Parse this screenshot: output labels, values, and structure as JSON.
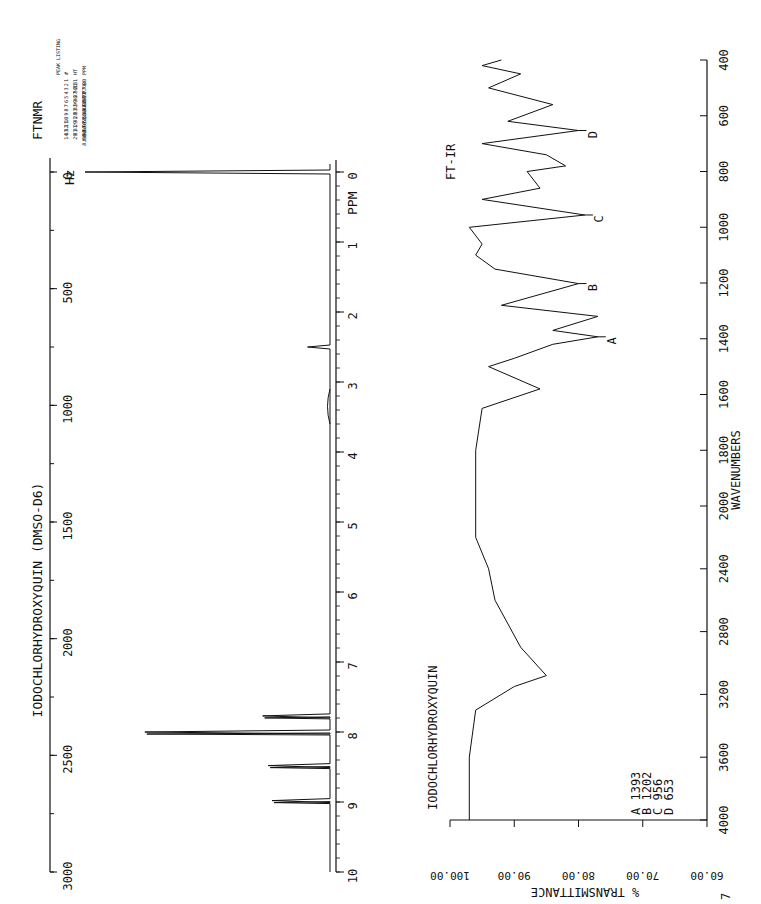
{
  "nmr": {
    "title": "IODOCHLORHYDROXYQUIN (DMSO-D6)",
    "instrument_label": "FTNMR",
    "hz_label": "Hz",
    "ppm_label": "PPM",
    "hz_ticks": [
      "0",
      "500",
      "1000",
      "1500",
      "2000",
      "2500",
      "3000"
    ],
    "ppm_ticks": [
      "0",
      "1",
      "2",
      "3",
      "4",
      "5",
      "6",
      "7",
      "8",
      "9",
      "10"
    ],
    "peak_listing": {
      "title": "PEAK LISTING",
      "headers": [
        "#",
        "HT",
        "PPM"
      ],
      "rows": [
        [
          "1",
          "131",
          ".00"
        ],
        [
          "2",
          "31",
          "7.76"
        ],
        [
          "3",
          "36",
          "7.77"
        ],
        [
          "4",
          "37",
          "7.78"
        ],
        [
          "5",
          "36",
          "7.80"
        ],
        [
          "6",
          "99",
          "8.00"
        ],
        [
          "7",
          "32",
          "8.46"
        ],
        [
          "8",
          "33",
          "8.48"
        ],
        [
          "9",
          "28",
          "8.51"
        ],
        [
          "10",
          "31",
          "8.51"
        ],
        [
          "11",
          "29",
          "8.97"
        ],
        [
          "12",
          "31",
          "8.97"
        ],
        [
          "13",
          "31",
          "8.98"
        ],
        [
          "14",
          "29",
          "8.99"
        ]
      ]
    }
  },
  "ir": {
    "title": "FT-IR",
    "compound": "IODOCHLORHYDROXYQUIN",
    "xlabel": "WAVENUMBERS",
    "ylabel": "% TRANSMITTANCE",
    "x_ticks": [
      "4000",
      "3600",
      "3200",
      "2800",
      "2400",
      "2000",
      "1800",
      "1600",
      "1400",
      "1200",
      "1000",
      "800",
      "600",
      "400"
    ],
    "y_ticks": [
      "60.00",
      "70.00",
      "80.00",
      "90.00",
      "100.00"
    ],
    "peak_labels": [
      {
        "label": "A",
        "value": "1393"
      },
      {
        "label": "B",
        "value": "1202"
      },
      {
        "label": "C",
        "value": "956"
      },
      {
        "label": "D",
        "value": "653"
      }
    ]
  },
  "page_number": "7",
  "chart_data": [
    {
      "type": "line",
      "title": "IODOCHLORHYDROXYQUIN (DMSO-D6) FTNMR",
      "xlabel": "PPM",
      "ylabel": "Intensity",
      "xlim": [
        0,
        10
      ],
      "secondary_axis": {
        "label": "Hz",
        "range": [
          0,
          3000
        ]
      },
      "peaks": [
        {
          "ppm": 0.0,
          "height": 131
        },
        {
          "ppm": 2.5,
          "height": 12
        },
        {
          "ppm": 7.77,
          "height": 36
        },
        {
          "ppm": 8.0,
          "height": 99
        },
        {
          "ppm": 8.48,
          "height": 33
        },
        {
          "ppm": 8.98,
          "height": 31
        }
      ]
    },
    {
      "type": "line",
      "title": "FT-IR IODOCHLORHYDROXYQUIN",
      "xlabel": "WAVENUMBERS",
      "ylabel": "% TRANSMITTANCE",
      "xlim": [
        4000,
        400
      ],
      "ylim": [
        60,
        100
      ],
      "series": [
        {
          "name": "transmittance",
          "x": [
            4000,
            3600,
            3300,
            3150,
            3080,
            2900,
            2600,
            2400,
            2200,
            2000,
            1800,
            1650,
            1580,
            1500,
            1470,
            1420,
            1393,
            1370,
            1320,
            1280,
            1202,
            1150,
            1100,
            1060,
            1000,
            956,
            900,
            860,
            800,
            780,
            740,
            700,
            653,
            620,
            560,
            500,
            450,
            420,
            400
          ],
          "y": [
            97,
            97,
            96,
            90,
            85,
            89,
            93,
            94,
            96,
            96,
            96,
            95,
            86,
            94,
            90,
            84,
            77,
            84,
            77,
            92,
            80,
            93,
            96,
            95,
            97,
            79,
            95,
            86,
            88,
            82,
            85,
            95,
            80,
            91,
            84,
            94,
            89,
            95,
            92
          ]
        }
      ],
      "annotations": [
        {
          "label": "A",
          "x": 1393
        },
        {
          "label": "B",
          "x": 1202
        },
        {
          "label": "C",
          "x": 956
        },
        {
          "label": "D",
          "x": 653
        }
      ]
    }
  ]
}
